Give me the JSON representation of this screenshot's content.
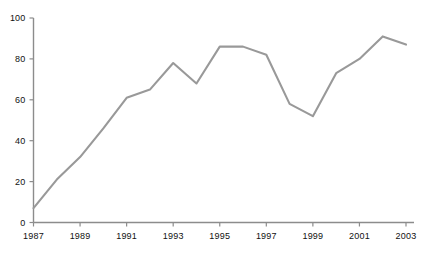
{
  "chart_data": {
    "type": "line",
    "title": "",
    "subtitle": "",
    "xlabel": "",
    "ylabel": "",
    "xlim": [
      1987,
      2003
    ],
    "ylim": [
      0,
      100
    ],
    "grid": false,
    "legend": false,
    "legend_position": "none",
    "line_color": "#999999",
    "axis_color": "#8c8c8c",
    "text_color": "#111111",
    "background_color": "#ffffff",
    "x": [
      1987,
      1988,
      1989,
      1990,
      1991,
      1992,
      1993,
      1994,
      1995,
      1996,
      1997,
      1998,
      1999,
      2000,
      2001,
      2002,
      2003
    ],
    "values": [
      7,
      21,
      32,
      46,
      61,
      65,
      78,
      68,
      86,
      86,
      82,
      58,
      52,
      73,
      80,
      91,
      87
    ],
    "x_tick_labels": [
      "1987",
      "1989",
      "1991",
      "1993",
      "1995",
      "1997",
      "1999",
      "2001",
      "2003"
    ],
    "x_tick_values": [
      1987,
      1989,
      1991,
      1993,
      1995,
      1997,
      1999,
      2001,
      2003
    ],
    "y_tick_labels": [
      "0",
      "20",
      "40",
      "60",
      "80",
      "100"
    ],
    "y_tick_values": [
      0,
      20,
      40,
      60,
      80,
      100
    ],
    "annotations": []
  }
}
